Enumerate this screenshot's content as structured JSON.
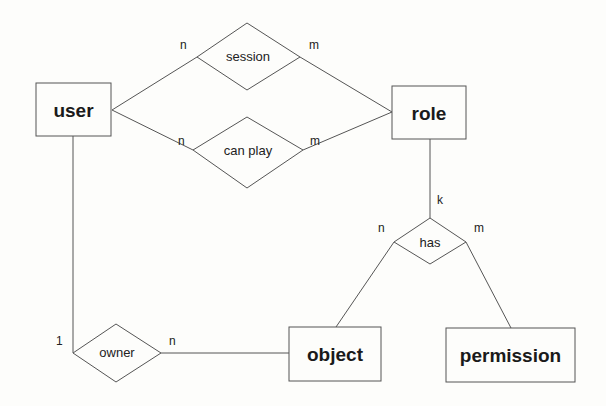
{
  "diagram": {
    "type": "ER diagram",
    "entities": [
      {
        "id": "user",
        "label": "user"
      },
      {
        "id": "role",
        "label": "role"
      },
      {
        "id": "object",
        "label": "object"
      },
      {
        "id": "permission",
        "label": "permission"
      }
    ],
    "relationships": [
      {
        "id": "session",
        "label": "session",
        "from": "user",
        "to": "role",
        "from_card": "n",
        "to_card": "m"
      },
      {
        "id": "can_play",
        "label": "can play",
        "from": "user",
        "to": "role",
        "from_card": "n",
        "to_card": "m"
      },
      {
        "id": "has",
        "label": "has",
        "from": "role",
        "to_left": "object",
        "to_right": "permission",
        "role_card": "k",
        "left_card": "n",
        "right_card": "m"
      },
      {
        "id": "owner",
        "label": "owner",
        "from": "user",
        "to": "object",
        "from_card": "1",
        "to_card": "n"
      }
    ]
  },
  "labels": {
    "user": "user",
    "role": "role",
    "object": "object",
    "permission": "permission",
    "session": "session",
    "can_play": "can play",
    "has": "has",
    "owner": "owner"
  },
  "cards": {
    "session_n": "n",
    "session_m": "m",
    "canplay_n": "n",
    "canplay_m": "m",
    "has_k": "k",
    "has_n": "n",
    "has_m": "m",
    "owner_1": "1",
    "owner_n": "n"
  }
}
